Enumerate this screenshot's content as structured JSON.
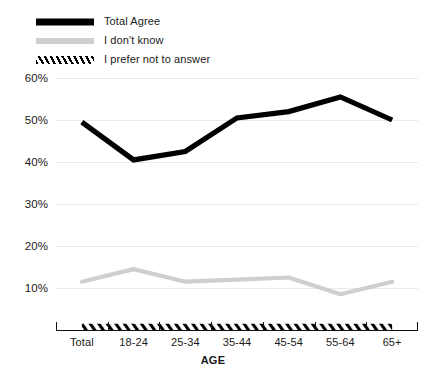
{
  "chart_data": {
    "type": "line",
    "title": "",
    "xlabel": "AGE",
    "ylabel": "",
    "categories": [
      "Total",
      "18-24",
      "25-34",
      "35-44",
      "45-54",
      "55-64",
      "65+"
    ],
    "ylim": [
      0,
      60
    ],
    "yticks": [
      10,
      20,
      30,
      40,
      50,
      60
    ],
    "ytick_labels": [
      "10%",
      "20%",
      "30%",
      "40%",
      "50%",
      "60%"
    ],
    "grid": true,
    "legend_position": "top-left",
    "series": [
      {
        "name": "Total Agree",
        "style": "solid",
        "color": "#000000",
        "values": [
          49.5,
          40.5,
          42.5,
          50.5,
          52,
          55.5,
          50
        ]
      },
      {
        "name": "I don't know",
        "style": "solid",
        "color": "#cfcfcf",
        "values": [
          11.5,
          14.5,
          11.5,
          12,
          12.5,
          8.5,
          11.5
        ]
      },
      {
        "name": "I prefer not to answer",
        "style": "hatched",
        "color": "#000000",
        "values": [
          1.5,
          1.5,
          1.5,
          1.5,
          1.5,
          1.5,
          1.5
        ]
      }
    ]
  },
  "legend": {
    "items": [
      {
        "label": "Total Agree",
        "swatch": "solid-black-line-swatch"
      },
      {
        "label": "I don't know",
        "swatch": "solid-gray-line-swatch"
      },
      {
        "label": "I prefer not to answer",
        "swatch": "hatched-band-swatch"
      }
    ]
  },
  "axis": {
    "x_title": "AGE"
  }
}
